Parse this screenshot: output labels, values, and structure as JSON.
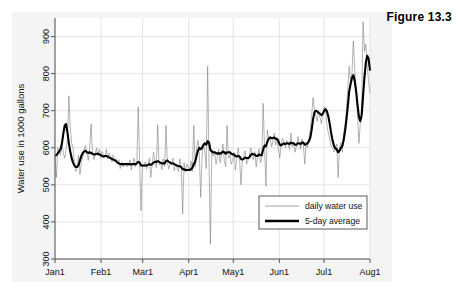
{
  "caption": "Figure 13.3",
  "chart_data": {
    "type": "line",
    "title": "",
    "xlabel": "",
    "ylabel": "Water use in 1000 gallons",
    "ylim": [
      300,
      950
    ],
    "yticks": [
      300,
      400,
      500,
      600,
      700,
      800,
      900
    ],
    "ytick_labels": [
      "300",
      "400",
      "500",
      "600",
      "700",
      "800",
      "900"
    ],
    "xlim": [
      0,
      212
    ],
    "xticks": [
      0,
      31,
      59,
      90,
      120,
      151,
      181,
      212
    ],
    "xtick_labels": [
      "Jan1",
      "Feb1",
      "Mar1",
      "Apr1",
      "May1",
      "Jun1",
      "Jul1",
      "Aug1"
    ],
    "grid": true,
    "legend_position": "bottom-right",
    "legend": [
      {
        "name": "daily water use",
        "style": "thin",
        "color": "#808080"
      },
      {
        "name": "5-day average",
        "style": "thick",
        "color": "#000000"
      }
    ],
    "series": [
      {
        "name": "daily water use",
        "color": "#808080",
        "width": 0.6,
        "values": [
          575,
          520,
          601,
          592,
          580,
          610,
          585,
          572,
          596,
          620,
          740,
          655,
          612,
          598,
          560,
          536,
          545,
          580,
          528,
          560,
          572,
          595,
          606,
          586,
          566,
          600,
          664,
          588,
          568,
          584,
          600,
          578,
          596,
          572,
          590,
          580,
          574,
          596,
          570,
          586,
          578,
          562,
          580,
          566,
          572,
          556,
          568,
          544,
          562,
          548,
          556,
          560,
          548,
          552,
          567,
          540,
          556,
          572,
          548,
          558,
          710,
          563,
          430,
          555,
          549,
          561,
          543,
          555,
          572,
          520,
          553,
          588,
          565,
          546,
          662,
          554,
          560,
          541,
          570,
          549,
          660,
          558,
          543,
          563,
          553,
          572,
          538,
          556,
          544,
          536,
          570,
          546,
          422,
          560,
          534,
          556,
          548,
          540,
          564,
          536,
          660,
          548,
          598,
          620,
          584,
          466,
          576,
          612,
          590,
          544,
          820,
          556,
          340,
          595,
          578,
          588,
          556,
          572,
          596,
          560,
          582,
          610,
          566,
          549,
          660,
          572,
          580,
          556,
          565,
          588,
          540,
          570,
          600,
          572,
          500,
          566,
          578,
          592,
          556,
          565,
          575,
          600,
          585,
          568,
          590,
          548,
          582,
          598,
          560,
          570,
          720,
          600,
          496,
          648,
          620,
          630,
          602,
          616,
          640,
          608,
          625,
          595,
          572,
          610,
          625,
          616,
          600,
          620,
          608,
          596,
          640,
          602,
          616,
          588,
          604,
          630,
          614,
          596,
          624,
          608,
          556,
          615,
          600,
          624,
          648,
          690,
          736,
          700,
          686,
          672,
          700,
          682,
          665,
          690,
          710,
          700,
          660,
          640,
          624,
          604,
          600,
          588,
          596,
          610,
          520,
          600,
          614,
          588,
          640,
          660,
          700,
          760,
          820,
          780,
          800,
          888,
          810,
          760,
          690,
          612,
          666,
          700,
          940,
          860,
          880,
          820,
          780,
          748
        ]
      },
      {
        "name": "5-day average",
        "color": "#000000",
        "width": 2.1,
        "values": [
          578,
          580,
          585,
          590,
          596,
          612,
          638,
          660,
          664,
          640,
          612,
          590,
          572,
          560,
          552,
          548,
          548,
          554,
          566,
          578,
          586,
          590,
          592,
          588,
          586,
          588,
          586,
          584,
          582,
          582,
          584,
          584,
          582,
          580,
          578,
          576,
          578,
          578,
          576,
          574,
          572,
          570,
          568,
          566,
          564,
          560,
          558,
          556,
          556,
          556,
          556,
          556,
          556,
          556,
          556,
          555,
          556,
          556,
          556,
          558,
          562,
          560,
          552,
          552,
          552,
          552,
          552,
          554,
          556,
          554,
          556,
          560,
          562,
          562,
          564,
          562,
          560,
          558,
          558,
          558,
          564,
          566,
          562,
          560,
          558,
          558,
          556,
          554,
          552,
          550,
          550,
          548,
          542,
          542,
          540,
          540,
          540,
          540,
          542,
          546,
          556,
          562,
          578,
          592,
          600,
          596,
          600,
          608,
          612,
          608,
          618,
          614,
          594,
          590,
          588,
          588,
          586,
          584,
          586,
          584,
          586,
          590,
          588,
          584,
          588,
          588,
          588,
          584,
          582,
          582,
          578,
          576,
          578,
          576,
          570,
          568,
          570,
          574,
          572,
          572,
          574,
          580,
          584,
          582,
          582,
          578,
          578,
          582,
          580,
          580,
          596,
          606,
          604,
          616,
          624,
          628,
          626,
          626,
          628,
          624,
          624,
          618,
          608,
          606,
          610,
          612,
          610,
          612,
          612,
          610,
          614,
          612,
          612,
          608,
          608,
          612,
          612,
          610,
          614,
          614,
          608,
          610,
          612,
          618,
          628,
          650,
          678,
          696,
          700,
          698,
          694,
          692,
          688,
          692,
          700,
          704,
          698,
          684,
          664,
          640,
          620,
          606,
          598,
          596,
          588,
          592,
          600,
          604,
          620,
          644,
          676,
          712,
          752,
          772,
          788,
          796,
          780,
          752,
          716,
          684,
          672,
          688,
          740,
          790,
          830,
          848,
          840,
          808
        ]
      }
    ]
  }
}
